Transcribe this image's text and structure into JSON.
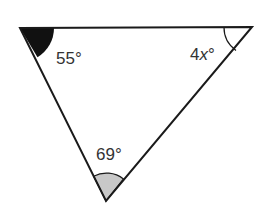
{
  "diagram": {
    "type": "triangle",
    "vertices": {
      "top_left": {
        "x": 20,
        "y": 28
      },
      "top_right": {
        "x": 252,
        "y": 27
      },
      "bottom": {
        "x": 106,
        "y": 201
      }
    },
    "angles": {
      "top_left": {
        "label_num": "55",
        "label_var": "",
        "degree": "°",
        "fill": "#111111"
      },
      "top_right": {
        "label_num": "4",
        "label_var": "x",
        "degree": "°",
        "fill": "none"
      },
      "bottom": {
        "label_num": "69",
        "label_var": "",
        "degree": "°",
        "fill": "#c8c8c8"
      }
    },
    "colors": {
      "stroke": "#1a1a1a",
      "text": "#333333",
      "background": "#ffffff"
    }
  }
}
